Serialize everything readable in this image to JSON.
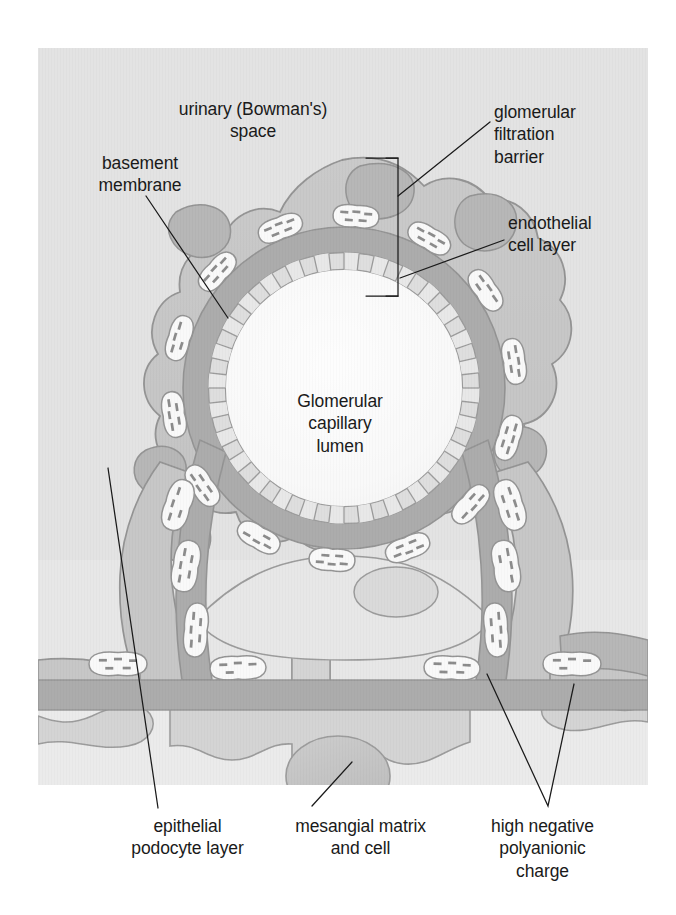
{
  "figure": {
    "panel": {
      "x": 38,
      "y": 48,
      "width": 610,
      "height": 737
    },
    "background_color": "#ffffff",
    "panel_color": "#c6c6c6"
  },
  "labels": {
    "urinary_space": "urinary (Bowman's)\nspace",
    "basement_membrane": "basement\nmembrane",
    "filtration_barrier": "glomerular\nfiltration\nbarrier",
    "endothelial_cell_layer": "endothelial\ncell layer",
    "capillary_lumen": "Glomerular\ncapillary\nlumen",
    "epithelial_podocyte": "epithelial\npodocyte layer",
    "mesangial": "mesangial matrix\nand cell",
    "polyanionic_charge": "high negative\npolyanionic\ncharge"
  },
  "colors": {
    "panel_bg": "#c6c6c6",
    "urinary_space": "#c3c3c3",
    "podocyte_body": "#8e8e8e",
    "podocyte_dark_nucleus": "#6e6e6e",
    "basement_membrane": "#5a5a5a",
    "filtration_slit_white": "#f2f2f2",
    "endothelial_cell": "#b8b8b8",
    "endothelial_cell_alt": "#d0d0d0",
    "lumen": "#f4f4f4",
    "mesangium_light": "#cfcfcf",
    "mesangium_mid": "#a8a8a8",
    "mesangial_cell": "#8a8a8a",
    "tubule_band": "#5a5a5a",
    "outline": "#2b2b2b",
    "charge_dash": "#1a1a1a",
    "leader_line": "#1a1a1a",
    "text": "#1a1a1a"
  },
  "structures": [
    {
      "name": "glomerular-capillary-lumen",
      "kind": "region",
      "note": "large pale circular lumen at centre"
    },
    {
      "name": "endothelial-cell-layer",
      "kind": "ring",
      "note": "ring of light grey brick-like fenestrated endothelial cells lining lumen"
    },
    {
      "name": "glomerular-basement-membrane",
      "kind": "ring",
      "note": "thick dark grey band outside endothelium"
    },
    {
      "name": "epithelial-podocyte-layer",
      "kind": "region",
      "note": "mid-grey foot processes wrapping outside of basement membrane"
    },
    {
      "name": "filtration-slit",
      "kind": "repeated",
      "count": 18,
      "note": "white lens-shaped slits between podocyte foot processes, each marked with negative-charge dashes"
    },
    {
      "name": "urinary-bowmans-space",
      "kind": "region",
      "note": "light grey space surrounding the tuft"
    },
    {
      "name": "mesangial-matrix",
      "kind": "region",
      "note": "mid-grey stalk below the capillary"
    },
    {
      "name": "mesangial-cell",
      "kind": "region",
      "note": "darker ovoid cell within the mesangial stalk"
    },
    {
      "name": "tubular-basement-band",
      "kind": "band",
      "note": "dark horizontal band crossing lower third"
    }
  ],
  "charge_markers": {
    "symbol": "dash",
    "meaning": "high negative polyanionic charge",
    "total": 64
  },
  "leaders": [
    {
      "from": "basement_membrane",
      "to": "glomerular-basement-membrane"
    },
    {
      "from": "filtration_barrier",
      "to": "filtration-barrier-bracket"
    },
    {
      "from": "endothelial_cell_layer",
      "to": "endothelial-cell-layer"
    },
    {
      "from": "epithelial_podocyte",
      "to": "epithelial-podocyte-layer"
    },
    {
      "from": "mesangial",
      "to": "mesangial-cell"
    },
    {
      "from": "polyanionic_charge",
      "to": "filtration-slit",
      "branches": 2
    }
  ]
}
